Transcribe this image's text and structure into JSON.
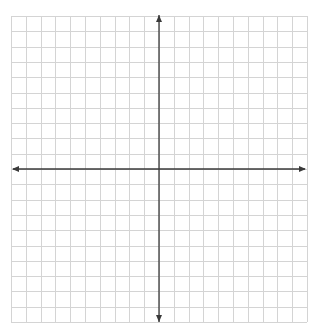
{
  "title": "",
  "chart_data": {
    "type": "coordinate-plane",
    "title": "",
    "xlabel": "",
    "ylabel": "",
    "xlim": [
      -10,
      10
    ],
    "ylim": [
      -10,
      10
    ],
    "grid": true,
    "grid_step": 1,
    "axes": {
      "x_arrows": [
        "left",
        "right"
      ],
      "y_arrows": [
        "up",
        "down"
      ]
    },
    "tick_labels": [],
    "points": [],
    "series": []
  },
  "colors": {
    "background": "#ffffff",
    "grid": "#d4d4d4",
    "axis": "#3a3a3a"
  }
}
